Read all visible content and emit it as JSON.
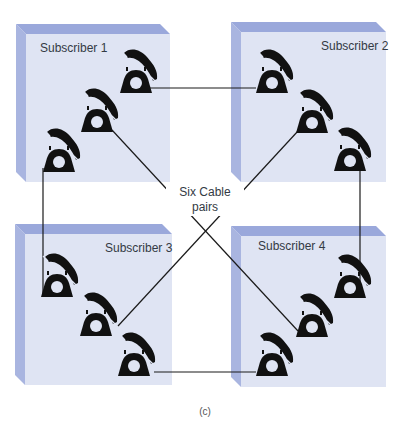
{
  "diagram": {
    "center_label_line1": "Six Cable",
    "center_label_line2": "pairs",
    "caption": "(c)",
    "colors": {
      "box_face": "#dfe4f3",
      "box_side": "#a9b5e0",
      "box_top": "#9aa8db",
      "wire": "#1a1a1a",
      "phone": "#111111"
    },
    "subscribers": [
      {
        "label": "Subscriber 1",
        "phones": 3
      },
      {
        "label": "Subscriber 2",
        "phones": 3
      },
      {
        "label": "Subscriber 3",
        "phones": 3
      },
      {
        "label": "Subscriber 4",
        "phones": 3
      }
    ],
    "connections": [
      {
        "from": "Subscriber 1",
        "to": "Subscriber 2"
      },
      {
        "from": "Subscriber 1",
        "to": "Subscriber 3"
      },
      {
        "from": "Subscriber 1",
        "to": "Subscriber 4"
      },
      {
        "from": "Subscriber 2",
        "to": "Subscriber 3"
      },
      {
        "from": "Subscriber 2",
        "to": "Subscriber 4"
      },
      {
        "from": "Subscriber 3",
        "to": "Subscriber 4"
      }
    ]
  }
}
